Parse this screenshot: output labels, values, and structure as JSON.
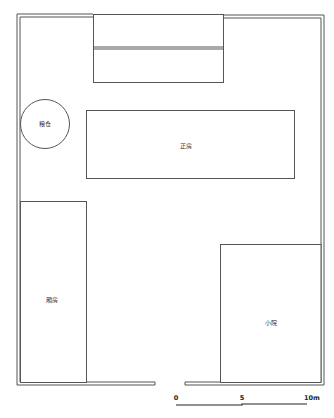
{
  "diagram": {
    "type": "architectural-site-plan",
    "colors": {
      "line": "#555555",
      "wall_fill": "#ffffff",
      "background": "#ffffff"
    },
    "rooms": [
      {
        "id": "granary",
        "label": "粮仓",
        "shape": "circle"
      },
      {
        "id": "main-hall",
        "label": "正房",
        "shape": "rect"
      },
      {
        "id": "side-room",
        "label": "厢房",
        "shape": "rect"
      },
      {
        "id": "small-yard",
        "label": "小院",
        "shape": "rect"
      },
      {
        "id": "north-building",
        "label": "",
        "shape": "rect-divided"
      }
    ],
    "scale_bar": {
      "labels": [
        "0",
        "5",
        "10m"
      ]
    }
  }
}
